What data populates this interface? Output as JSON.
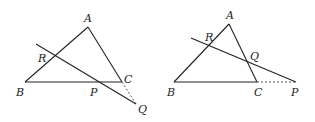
{
  "figures": [
    {
      "id": "left",
      "description": "Triangle ABC with transversal through R (on AB), P (on BC) meeting extension of AC at Q",
      "points": {
        "A": {
          "label": "A",
          "x": 88,
          "y": 27
        },
        "B": {
          "label": "B",
          "x": 25,
          "y": 82
        },
        "C": {
          "label": "C",
          "x": 122,
          "y": 82
        },
        "R": {
          "label": "R",
          "x": 54,
          "y": 57
        },
        "P": {
          "label": "P",
          "x": 98,
          "y": 82
        },
        "Q": {
          "label": "Q",
          "x": 136,
          "y": 104
        }
      },
      "secant_start": {
        "x": 36,
        "y": 44
      },
      "dashed_extension": [
        "C",
        "Q"
      ]
    },
    {
      "id": "right",
      "description": "Triangle ABC with transversal through R (on AB), Q (on AC) meeting extension of BC at P",
      "points": {
        "A": {
          "label": "A",
          "x": 229,
          "y": 24
        },
        "B": {
          "label": "B",
          "x": 174,
          "y": 82
        },
        "C": {
          "label": "C",
          "x": 257,
          "y": 82
        },
        "R": {
          "label": "R",
          "x": 209,
          "y": 46
        },
        "Q": {
          "label": "Q",
          "x": 248,
          "y": 63
        },
        "P": {
          "label": "P",
          "x": 296,
          "y": 82
        }
      },
      "secant_start": {
        "x": 191,
        "y": 38
      },
      "dashed_extension": [
        "C",
        "P"
      ]
    }
  ],
  "labels": {
    "left": {
      "A": "A",
      "B": "B",
      "C": "C",
      "R": "R",
      "P": "P",
      "Q": "Q"
    },
    "right": {
      "A": "A",
      "B": "B",
      "C": "C",
      "R": "R",
      "Q": "Q",
      "P": "P"
    }
  },
  "colors": {
    "line": "#222222",
    "dashed": "#555555",
    "background": "#ffffff"
  }
}
